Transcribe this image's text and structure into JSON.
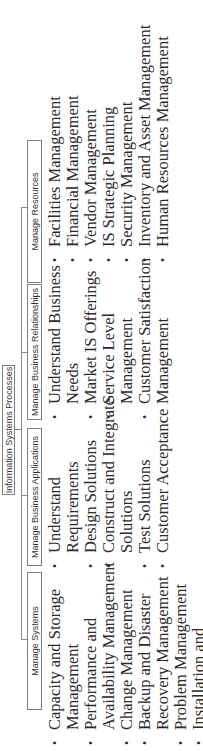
{
  "diagram": {
    "root": {
      "label": "Information Systems Processes"
    },
    "columns": [
      {
        "label": "Manage Systems",
        "items": [
          "Capacity and Storage Management",
          "Performance and Availability Management",
          "Change Management",
          "Backup and Disaster Recovery Management",
          "Problem Management",
          "Installation and"
        ],
        "lines": [
          [
            "Capacity and Storage",
            "Management"
          ],
          [
            "Performance and",
            "Availability Management"
          ],
          [
            "Change Management"
          ],
          [
            "Backup and Disaster",
            "Recovery Management"
          ],
          [
            "Problem Management"
          ],
          [
            "Installation and"
          ]
        ]
      },
      {
        "label": "Manage Business Applications",
        "items": [
          "Understand Requirements",
          "Design Solutions",
          "Construct and Integrate Solutions",
          "Test Solutions",
          "Customer Acceptance"
        ],
        "lines": [
          [
            "Understand",
            "Requirements"
          ],
          [
            "Design Solutions"
          ],
          [
            "Construct and Integrate",
            "Solutions"
          ],
          [
            "Test Solutions"
          ],
          [
            "Customer Acceptance"
          ]
        ]
      },
      {
        "label": "Manage Business Relationships",
        "items": [
          "Understand Business Needs",
          "Market IS Offerings",
          "Service Level Management",
          "Customer Satisfaction Management"
        ],
        "lines": [
          [
            "Understand Business",
            "Needs"
          ],
          [
            "Market IS Offerings"
          ],
          [
            "Service Level",
            "Management"
          ],
          [
            "Customer Satisfaction",
            "Management"
          ]
        ]
      },
      {
        "label": "Manage Resources",
        "items": [
          "Facilities Management",
          "Financial Management",
          "Vendor Management",
          "IS Strategic Planning",
          "Security Management",
          "Inventory and Asset Management",
          "Human Resources Management"
        ],
        "lines": [
          [
            "Facilities Management"
          ],
          [
            "Financial Management"
          ],
          [
            "Vendor Management"
          ],
          [
            "IS Strategic Planning"
          ],
          [
            "Security Management"
          ],
          [
            "Inventory and Asset Management"
          ],
          [
            "Human Resources Management"
          ]
        ]
      }
    ],
    "colors": {
      "line": "#8a8a8a",
      "box_border": "#808080",
      "text": "#2a2a2a",
      "background": "#ffffff"
    },
    "orientation": "rotated -90deg"
  }
}
